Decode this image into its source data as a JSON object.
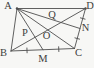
{
  "figure": {
    "width": 94,
    "height": 68,
    "background_color": "#f7f7f5",
    "line_color": "#4e4e4e",
    "label_color": "#3d3d3d",
    "points": {
      "A": {
        "x": 17,
        "y": 8.5
      },
      "B": {
        "x": 11,
        "y": 51
      },
      "C": {
        "x": 74.5,
        "y": 48.5
      },
      "D": {
        "x": 85.5,
        "y": 8.5
      },
      "M": {
        "x": 43,
        "y": 49.8
      },
      "N": {
        "x": 80,
        "y": 28.5
      },
      "P": {
        "x": 35.1,
        "y": 37.2
      },
      "O": {
        "x": 47.9,
        "y": 30.0
      },
      "Q": {
        "x": 61,
        "y": 22.5
      }
    },
    "edges": [
      {
        "from": "A",
        "to": "D"
      },
      {
        "from": "D",
        "to": "C"
      },
      {
        "from": "C",
        "to": "B"
      },
      {
        "from": "B",
        "to": "A"
      },
      {
        "from": "A",
        "to": "C"
      },
      {
        "from": "B",
        "to": "D"
      },
      {
        "from": "A",
        "to": "M"
      },
      {
        "from": "A",
        "to": "N"
      }
    ],
    "ticks": [
      {
        "on": [
          "B",
          "M"
        ]
      },
      {
        "on": [
          "M",
          "C"
        ]
      },
      {
        "on": [
          "D",
          "N"
        ]
      },
      {
        "on": [
          "N",
          "C"
        ]
      }
    ],
    "dots": [
      "A",
      "D"
    ],
    "labels": [
      {
        "text": "A",
        "x": 8,
        "y": 5.5,
        "name": "vertex-label-A"
      },
      {
        "text": "D",
        "x": 90,
        "y": 5.5,
        "name": "vertex-label-D"
      },
      {
        "text": "B",
        "x": 3.5,
        "y": 53,
        "name": "vertex-label-B"
      },
      {
        "text": "C",
        "x": 78.5,
        "y": 53,
        "name": "vertex-label-C"
      },
      {
        "text": "M",
        "x": 43,
        "y": 58.5,
        "name": "midpoint-label-M"
      },
      {
        "text": "N",
        "x": 85.5,
        "y": 28,
        "name": "midpoint-label-N"
      },
      {
        "text": "P",
        "x": 25,
        "y": 32.5,
        "name": "intersection-label-P"
      },
      {
        "text": "Q",
        "x": 52,
        "y": 15,
        "name": "intersection-label-Q"
      },
      {
        "text": "O",
        "x": 46.5,
        "y": 36,
        "name": "intersection-label-O"
      }
    ]
  }
}
